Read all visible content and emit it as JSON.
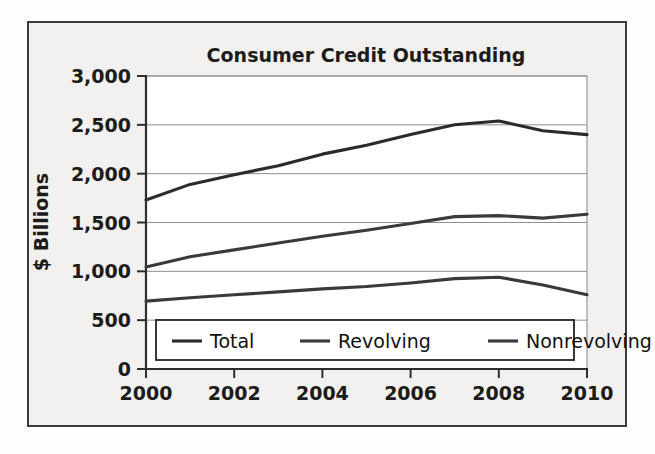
{
  "figure": {
    "title": "Consumer Credit Outstanding",
    "background_color": "#f2f1ef",
    "frame_color": "#3b3b3b",
    "ink_color": "#2e2e2e"
  },
  "axes": {
    "y_label": "$ Billions",
    "y_ticks": [
      "0",
      "500",
      "1,000",
      "1,500",
      "2,000",
      "2,500",
      "3,000"
    ],
    "x_ticks": [
      "2000",
      "2002",
      "2004",
      "2006",
      "2008",
      "2010"
    ]
  },
  "legend": {
    "position": "bottom-center-inside",
    "items": [
      {
        "label": "Total",
        "color": "#2b2b2b"
      },
      {
        "label": "Revolving",
        "color": "#3a3a3a"
      },
      {
        "label": "Nonrevolving",
        "color": "#3a3a3a"
      }
    ]
  },
  "chart_data": {
    "type": "line",
    "title": "Consumer Credit Outstanding",
    "subtitle": "",
    "xlabel": "",
    "ylabel": "$ Billions",
    "xlim": [
      2000,
      2010
    ],
    "ylim": [
      0,
      3000
    ],
    "ytick_step": 500,
    "xtick_step": 2,
    "grid": true,
    "grid_axis": "y",
    "legend_entries": [
      "Total",
      "Revolving",
      "Nonrevolving"
    ],
    "x": [
      2000,
      2001,
      2002,
      2003,
      2004,
      2005,
      2006,
      2007,
      2008,
      2009,
      2010
    ],
    "series": [
      {
        "name": "Total",
        "color": "#2b2b2b",
        "values": [
          1730,
          1890,
          1990,
          2080,
          2200,
          2290,
          2400,
          2500,
          2540,
          2440,
          2400
        ]
      },
      {
        "name": "Revolving",
        "color": "#3a3a3a",
        "values": [
          1045,
          1150,
          1220,
          1290,
          1360,
          1420,
          1490,
          1560,
          1570,
          1545,
          1585
        ]
      },
      {
        "name": "Nonrevolving",
        "color": "#3a3a3a",
        "values": [
          695,
          730,
          760,
          790,
          820,
          845,
          880,
          925,
          940,
          860,
          760
        ]
      }
    ]
  }
}
